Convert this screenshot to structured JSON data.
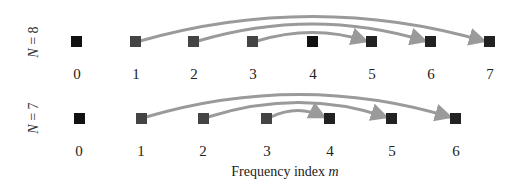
{
  "colors": {
    "dc_square": "#111111",
    "mirror_square": "#111111",
    "source_square": "#444444",
    "arrow": "#9a9a9a"
  },
  "rows": [
    {
      "label": "N = 8",
      "label_var": "N",
      "label_eq": " = 8",
      "N": 8,
      "indices": [
        "0",
        "1",
        "2",
        "3",
        "4",
        "5",
        "6",
        "7"
      ],
      "arrows": [
        {
          "from": 1,
          "to": 7
        },
        {
          "from": 2,
          "to": 6
        },
        {
          "from": 3,
          "to": 5
        }
      ]
    },
    {
      "label": "N = 7",
      "label_var": "N",
      "label_eq": " = 7",
      "N": 7,
      "indices": [
        "0",
        "1",
        "2",
        "3",
        "4",
        "5",
        "6"
      ],
      "arrows": [
        {
          "from": 1,
          "to": 6
        },
        {
          "from": 2,
          "to": 5
        },
        {
          "from": 3,
          "to": 4
        }
      ]
    }
  ],
  "xaxis": {
    "label": "Frequency index ",
    "label_var": "m"
  }
}
